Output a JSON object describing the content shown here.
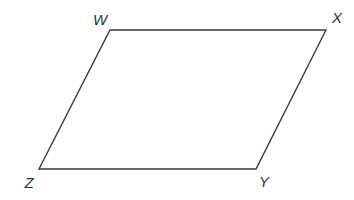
{
  "diagram": {
    "type": "parallelogram",
    "stroke_color": "#3a3a3a",
    "label_color": "#333333",
    "vertices": [
      {
        "label": "W",
        "x": 110,
        "y": 30,
        "label_x": 100,
        "label_y": 25
      },
      {
        "label": "X",
        "x": 326,
        "y": 30,
        "label_x": 337,
        "label_y": 23
      },
      {
        "label": "Y",
        "x": 256,
        "y": 169,
        "label_x": 264,
        "label_y": 187
      },
      {
        "label": "Z",
        "x": 39,
        "y": 169,
        "label_x": 29,
        "label_y": 188
      }
    ]
  }
}
